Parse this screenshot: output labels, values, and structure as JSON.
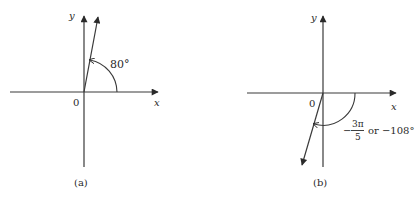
{
  "figures": [
    {
      "id": "a",
      "caption": "(a)",
      "origin_label": "0",
      "x_axis_label": "x",
      "y_axis_label": "y",
      "angle_degrees": 80,
      "angle_label": "80°"
    },
    {
      "id": "b",
      "caption": "(b)",
      "origin_label": "0",
      "x_axis_label": "x",
      "y_axis_label": "y",
      "angle_degrees": -108,
      "angle_label_numerator": "3π",
      "angle_label_denominator": "5",
      "angle_label_sign": "−",
      "angle_label_suffix": "or −108°"
    }
  ],
  "colors": {
    "line": "#3a3a3a",
    "text": "#2a2a2a",
    "background": "#ffffff"
  }
}
